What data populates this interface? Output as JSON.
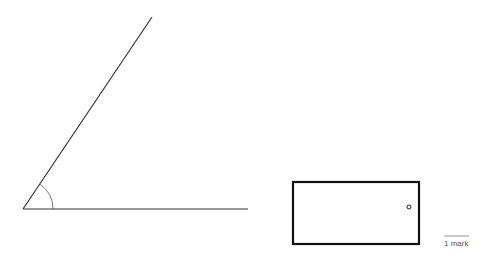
{
  "diagram": {
    "angle": {
      "vertex": [
        23,
        209
      ],
      "ray1_end": [
        152,
        17
      ],
      "ray2_end": [
        248,
        209
      ],
      "arc_radius": 30
    },
    "rectangle": {
      "x": 292,
      "y": 182,
      "width": 128,
      "height": 63
    },
    "circle": {
      "cx": 409,
      "cy": 207,
      "r": 2
    },
    "scale": {
      "label": "1 mark",
      "x1": 444,
      "x2": 469,
      "y": 237
    }
  }
}
